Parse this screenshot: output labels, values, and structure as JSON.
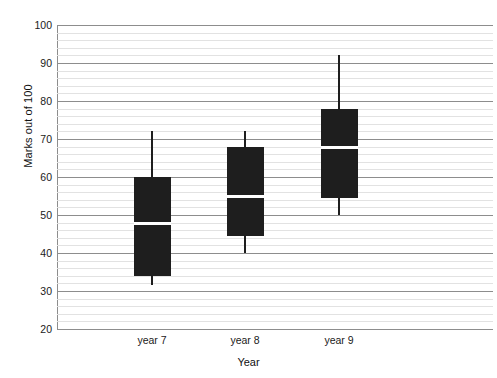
{
  "chart_data": {
    "type": "box",
    "title": "",
    "xlabel": "Year",
    "ylabel": "Marks out of 100",
    "categories": [
      "year 7",
      "year 8",
      "year 9"
    ],
    "ylim": [
      20,
      100
    ],
    "y_ticks": [
      100,
      90,
      80,
      70,
      60,
      50,
      40,
      30,
      20
    ],
    "y_tick_labels": [
      "100",
      "90",
      "80",
      "70",
      "60",
      "50",
      "40",
      "30",
      "20"
    ],
    "y_major_step": 10,
    "y_minor_step": 2,
    "grid": "horizontal",
    "legend": "none",
    "box_color": "#1e1e1e",
    "median_color": "#ffffff",
    "gridline_major_color": "#8d8d8d",
    "gridline_minor_color": "#e2e2e2",
    "series": [
      {
        "name": "year 7",
        "min": 31.5,
        "q1": 34,
        "median": 48,
        "q3": 60,
        "max": 72
      },
      {
        "name": "year 8",
        "min": 40,
        "q1": 44.5,
        "median": 55,
        "q3": 68,
        "max": 72
      },
      {
        "name": "year 9",
        "min": 50,
        "q1": 54.5,
        "median": 68,
        "q3": 78,
        "max": 92
      }
    ]
  },
  "axes": {
    "y_title": "Marks out of 100",
    "x_title": "Year"
  },
  "x_labels": {
    "0": "year 7",
    "1": "year 8",
    "2": "year 9"
  },
  "y_labels": {
    "0": "100",
    "1": "90",
    "2": "80",
    "3": "70",
    "4": "60",
    "5": "50",
    "6": "40",
    "7": "30",
    "8": "20"
  }
}
